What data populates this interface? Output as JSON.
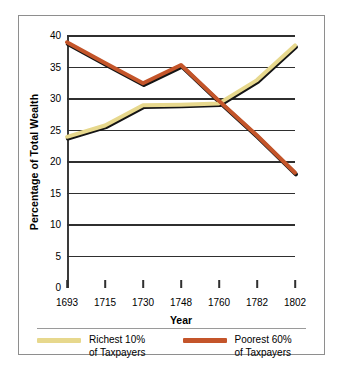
{
  "chart_data": {
    "type": "line",
    "title": "",
    "xlabel": "Year",
    "ylabel": "Percentage of Total Wealth",
    "categories": [
      "1693",
      "1715",
      "1730",
      "1748",
      "1760",
      "1782",
      "1802"
    ],
    "ylim": [
      0,
      40
    ],
    "yticks": [
      0,
      5,
      10,
      15,
      20,
      25,
      30,
      35,
      40
    ],
    "ytick_labels": [
      "0",
      "5",
      "10",
      "15",
      "20",
      "25",
      "30",
      "35",
      "40"
    ],
    "grid": "horizontal",
    "legend_position": "bottom",
    "series": [
      {
        "name": "Richest 10%\nof Taxpayers",
        "name_line1": "Richest 10%",
        "name_line2": "of Taxpayers",
        "color": "#E7D88D",
        "values": [
          24.0,
          25.8,
          29.0,
          29.1,
          29.3,
          33.0,
          38.5
        ]
      },
      {
        "name": "Poorest 60%\nof Taxpayers",
        "name_line1": "Poorest 60%",
        "name_line2": "of Taxpayers",
        "color": "#C4552A",
        "values": [
          39.0,
          35.7,
          32.5,
          35.4,
          29.7,
          24.2,
          18.3
        ]
      }
    ]
  },
  "axes": {
    "y_title": "Percentage of Total Wealth",
    "x_title": "Year"
  },
  "legend": {
    "items": [
      {
        "line1": "Richest 10%",
        "line2": "of Taxpayers",
        "color": "#E7D88D"
      },
      {
        "line1": "Poorest 60%",
        "line2": "of Taxpayers",
        "color": "#C4552A"
      }
    ]
  },
  "colors": {
    "richest": "#E7D88D",
    "poorest": "#C4552A",
    "grid": "#2f2f2f",
    "border": "#8e8e8e",
    "background": "#ffffff"
  }
}
